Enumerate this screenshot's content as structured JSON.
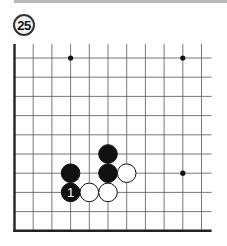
{
  "problem": {
    "number": "25"
  },
  "board": {
    "origin_x": 14.5,
    "origin_y": 58,
    "spacing_x": 18.7,
    "spacing_y": 19.2,
    "cols": 11,
    "rows": 10,
    "top_extend": 14,
    "right_extend": 10,
    "edges": [
      "left",
      "bottom"
    ],
    "star_points": [
      {
        "col": 3,
        "row": 0
      },
      {
        "col": 9,
        "row": 0
      },
      {
        "col": 9,
        "row": 6
      }
    ],
    "stones": [
      {
        "color": "black",
        "col": 3,
        "row": 6,
        "label": ""
      },
      {
        "color": "black",
        "col": 3,
        "row": 7,
        "label": "1"
      },
      {
        "color": "white",
        "col": 4,
        "row": 7,
        "label": ""
      },
      {
        "color": "white",
        "col": 5,
        "row": 7,
        "label": ""
      },
      {
        "color": "black",
        "col": 5,
        "row": 5,
        "label": ""
      },
      {
        "color": "black",
        "col": 5,
        "row": 6,
        "label": ""
      },
      {
        "color": "white",
        "col": 6,
        "row": 6,
        "label": ""
      }
    ]
  }
}
